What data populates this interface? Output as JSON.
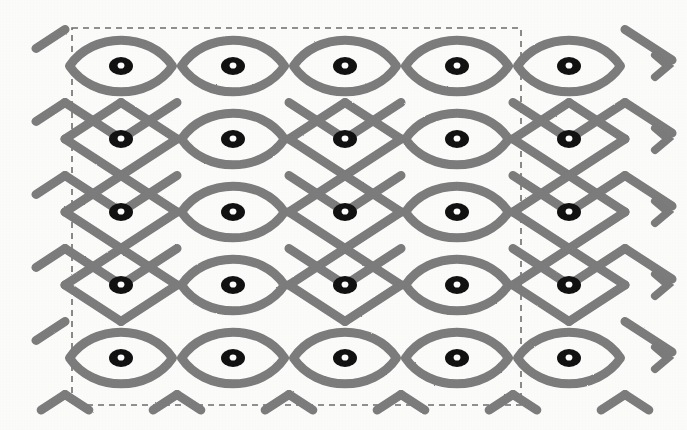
{
  "figure": {
    "type": "diagram",
    "background_color": "#fbfbfa",
    "canvas": {
      "width": 687,
      "height": 430
    }
  },
  "boundary": {
    "name": "dashed-tile-boundary",
    "shape": "rectangle",
    "stroke_color": "#6e6e6e",
    "stroke_width": 1.6,
    "dash_pattern": "6 5",
    "x": 72,
    "y": 28,
    "width": 449,
    "height": 377
  },
  "lattice": {
    "stroke_color": "#7b7b7b",
    "stroke_width": 9,
    "line_cap": "round",
    "cell_width": 112,
    "cell_height": 73,
    "origin_x": 121,
    "origin_y": 66,
    "columns": 5,
    "rows": 5
  },
  "dots": {
    "name": "kolam-dot",
    "count": 25,
    "outer_color": "#121212",
    "inner_color": "#fdfdfd",
    "outer_radius_x": 12,
    "outer_radius_y": 9,
    "inner_radius_x": 3.4,
    "inner_radius_y": 3.1,
    "columns_x": [
      121,
      233,
      345,
      457,
      569
    ],
    "rows_y": [
      66,
      139,
      212,
      285,
      358
    ],
    "loop_columns_top": [
      1,
      2,
      3,
      4,
      5
    ],
    "loop_columns_middle": [
      2,
      4
    ],
    "loop_columns_bottom": [
      1,
      2,
      3,
      4,
      5
    ]
  },
  "rows": [
    {
      "index": 1,
      "label": "row-1-top",
      "y": 66,
      "loop_columns": [
        1,
        2,
        3,
        4,
        5
      ]
    },
    {
      "index": 2,
      "label": "row-2",
      "y": 139,
      "loop_columns": [
        2,
        4
      ]
    },
    {
      "index": 3,
      "label": "row-3",
      "y": 212,
      "loop_columns": [
        2,
        4
      ]
    },
    {
      "index": 4,
      "label": "row-4",
      "y": 285,
      "loop_columns": [
        2,
        4
      ]
    },
    {
      "index": 5,
      "label": "row-5-bottom",
      "y": 358,
      "loop_columns": [
        1,
        2,
        3,
        4,
        5
      ]
    }
  ],
  "edge_terminations": {
    "name": "arrow-tip",
    "side": "right",
    "count": 5,
    "y_positions": [
      66,
      139,
      212,
      285,
      358
    ],
    "x": 668
  },
  "left_extensions": {
    "name": "left-open-strand",
    "count": 5,
    "y_positions": [
      66,
      139,
      212,
      285,
      358
    ],
    "x": 40
  }
}
